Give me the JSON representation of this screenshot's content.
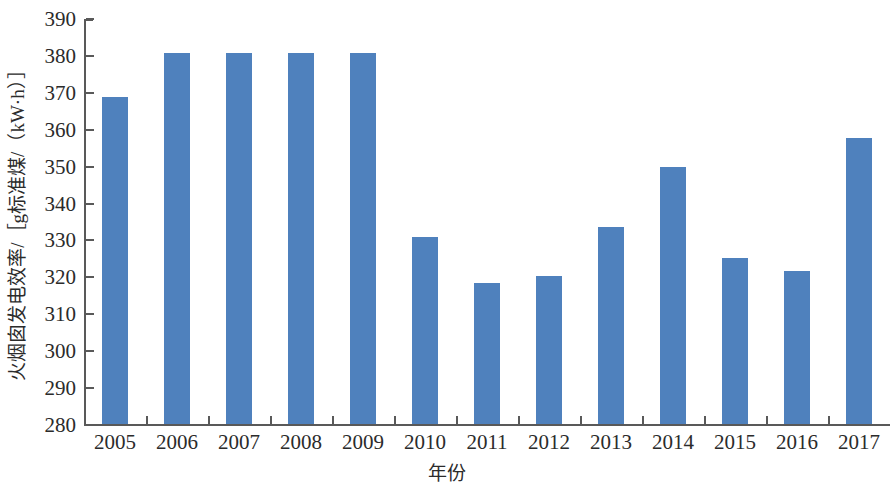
{
  "chart_data": {
    "type": "bar",
    "title": "",
    "xlabel": "年份",
    "ylabel": "火烟囱发电效率/［g标准煤/（kW·h）］",
    "categories": [
      "2005",
      "2006",
      "2007",
      "2008",
      "2009",
      "2010",
      "2011",
      "2012",
      "2013",
      "2014",
      "2015",
      "2016",
      "2017"
    ],
    "values": [
      368.7,
      380.5,
      380.5,
      380.5,
      380.6,
      330.6,
      318.2,
      320.0,
      333.4,
      349.7,
      324.9,
      321.4,
      357.6
    ],
    "series": [
      {
        "name": "火烟囱发电效率",
        "values": [
          368.7,
          380.5,
          380.5,
          380.5,
          380.6,
          330.6,
          318.2,
          320.0,
          333.4,
          349.7,
          324.9,
          321.4,
          357.6
        ]
      }
    ],
    "ylim": [
      280,
      390
    ],
    "ytick_values": [
      280,
      290,
      300,
      310,
      320,
      330,
      340,
      350,
      360,
      370,
      380,
      390
    ],
    "ytick_labels": [
      "280",
      "290",
      "300",
      "310",
      "320",
      "330",
      "340",
      "350",
      "360",
      "370",
      "380",
      "390"
    ],
    "grid": false,
    "legend": false,
    "bar_color": "#4f81bd",
    "axis_color": "#595959"
  }
}
